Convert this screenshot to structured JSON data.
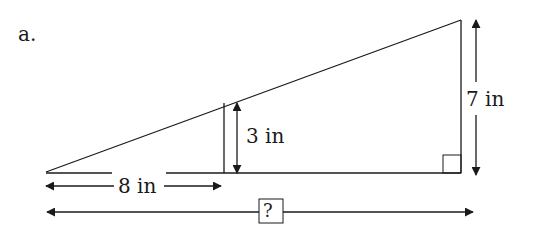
{
  "problem": {
    "label": "a.",
    "figure": "similar right triangles",
    "measurements": {
      "small_leg": "3 in",
      "large_leg": "7 in",
      "small_base": "8 in",
      "unknown_base": "?"
    }
  },
  "colors": {
    "stroke": "#1a1a1a",
    "background": "#ffffff"
  }
}
